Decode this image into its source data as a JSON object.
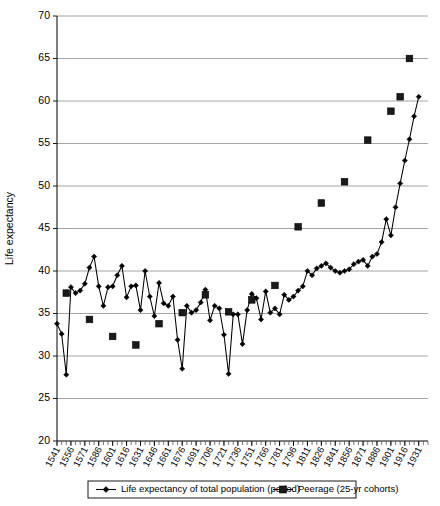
{
  "chart_data": {
    "type": "line",
    "title": "",
    "xlabel": "",
    "ylabel": "Life expectancy",
    "ylim": [
      20,
      70
    ],
    "ytick_step": 5,
    "yticks": [
      20,
      25,
      30,
      35,
      40,
      45,
      50,
      55,
      60,
      65,
      70
    ],
    "xlim": [
      1541,
      1941
    ],
    "xtick_step": 15,
    "xminor_step": 5,
    "grid": "horizontal",
    "legend_position": "bottom",
    "categories": [
      1541,
      1546,
      1551,
      1556,
      1561,
      1566,
      1571,
      1576,
      1581,
      1586,
      1591,
      1596,
      1601,
      1606,
      1611,
      1616,
      1621,
      1626,
      1631,
      1636,
      1641,
      1646,
      1651,
      1656,
      1661,
      1666,
      1671,
      1676,
      1681,
      1686,
      1691,
      1696,
      1701,
      1706,
      1711,
      1716,
      1721,
      1726,
      1731,
      1736,
      1741,
      1746,
      1751,
      1756,
      1761,
      1766,
      1771,
      1776,
      1781,
      1786,
      1791,
      1796,
      1801,
      1806,
      1811,
      1816,
      1821,
      1826,
      1831,
      1836,
      1841,
      1846,
      1851,
      1856,
      1861,
      1866,
      1871,
      1876,
      1881,
      1886,
      1891,
      1896,
      1901,
      1906,
      1911,
      1916,
      1921,
      1926,
      1931
    ],
    "xtick_labels": [
      1541,
      1556,
      1571,
      1586,
      1601,
      1616,
      1631,
      1646,
      1661,
      1676,
      1691,
      1706,
      1721,
      1736,
      1751,
      1766,
      1781,
      1796,
      1811,
      1826,
      1841,
      1856,
      1871,
      1886,
      1901,
      1916,
      1931
    ],
    "series": [
      {
        "name": "Life expectancy of total population (period)",
        "marker": "diamond",
        "color": "#000000",
        "x": [
          1541,
          1546,
          1551,
          1556,
          1561,
          1566,
          1571,
          1576,
          1581,
          1586,
          1591,
          1596,
          1601,
          1606,
          1611,
          1616,
          1621,
          1626,
          1631,
          1636,
          1641,
          1646,
          1651,
          1656,
          1661,
          1666,
          1671,
          1676,
          1681,
          1686,
          1691,
          1696,
          1701,
          1706,
          1711,
          1716,
          1721,
          1726,
          1731,
          1736,
          1741,
          1746,
          1751,
          1756,
          1761,
          1766,
          1771,
          1776,
          1781,
          1786,
          1791,
          1796,
          1801,
          1806,
          1811,
          1816,
          1821,
          1826,
          1831,
          1836,
          1841,
          1846,
          1851,
          1856,
          1861,
          1866,
          1871,
          1876,
          1881,
          1886,
          1891,
          1896,
          1901,
          1906,
          1911,
          1916,
          1921,
          1926,
          1931
        ],
        "values": [
          33.8,
          32.6,
          27.8,
          38.1,
          37.4,
          37.7,
          38.5,
          40.4,
          41.7,
          38.2,
          35.9,
          38.1,
          38.2,
          39.5,
          40.6,
          36.9,
          38.2,
          38.3,
          35.4,
          40.0,
          37.0,
          34.7,
          38.6,
          36.2,
          35.9,
          37.0,
          31.9,
          28.5,
          35.9,
          35.1,
          35.4,
          36.3,
          37.8,
          34.2,
          35.9,
          35.6,
          32.5,
          27.9,
          34.9,
          34.9,
          31.4,
          35.4,
          37.3,
          36.8,
          34.3,
          37.6,
          35.1,
          35.6,
          34.9,
          37.2,
          36.6,
          37.0,
          37.7,
          38.2,
          40.0,
          39.5,
          40.3,
          40.6,
          40.9,
          40.4,
          40.0,
          39.8,
          40.0,
          40.2,
          40.8,
          41.1,
          41.3,
          40.6,
          41.7,
          42.0,
          43.4,
          46.1,
          44.2,
          47.5,
          50.3,
          53.0,
          55.5,
          58.2,
          60.5
        ]
      },
      {
        "name": "Peerage (25-yr cohorts)",
        "marker": "square",
        "color": "#1a1a1a",
        "x": [
          1551,
          1576,
          1601,
          1626,
          1651,
          1676,
          1701,
          1726,
          1751,
          1776,
          1801,
          1826,
          1851,
          1876,
          1901
        ],
        "values": [
          37.4,
          34.3,
          32.3,
          31.3,
          33.8,
          35.1,
          37.2,
          35.2,
          36.6,
          38.3,
          45.2,
          48.0,
          50.5,
          55.4,
          58.8
        ]
      },
      {
        "name": "Peerage (25-yr cohorts) later",
        "marker": "square",
        "color": "#1a1a1a",
        "x": [
          1911,
          1921
        ],
        "values": [
          60.5,
          65.0
        ]
      }
    ],
    "legend": [
      {
        "label": "Life expectancy of total population (period)",
        "marker": "diamond"
      },
      {
        "label": "Peerage (25-yr cohorts)",
        "marker": "square"
      }
    ]
  }
}
